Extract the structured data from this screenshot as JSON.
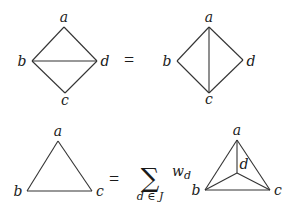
{
  "equations": [
    {
      "id": "eq1",
      "operator": "=",
      "lhs": {
        "graph": "diamond-with-bd-diagonal",
        "vertices": {
          "a": "a",
          "b": "b",
          "c": "c",
          "d": "d"
        },
        "edges": [
          [
            "a",
            "b"
          ],
          [
            "a",
            "d"
          ],
          [
            "b",
            "c"
          ],
          [
            "c",
            "d"
          ],
          [
            "b",
            "d"
          ]
        ]
      },
      "rhs": {
        "graph": "diamond-with-ac-diagonal",
        "vertices": {
          "a": "a",
          "b": "b",
          "c": "c",
          "d": "d"
        },
        "edges": [
          [
            "a",
            "b"
          ],
          [
            "a",
            "d"
          ],
          [
            "b",
            "c"
          ],
          [
            "c",
            "d"
          ],
          [
            "a",
            "c"
          ]
        ]
      }
    },
    {
      "id": "eq2",
      "operator": "=",
      "lhs": {
        "graph": "triangle",
        "vertices": {
          "a": "a",
          "b": "b",
          "c": "c"
        },
        "edges": [
          [
            "a",
            "b"
          ],
          [
            "b",
            "c"
          ],
          [
            "a",
            "c"
          ]
        ]
      },
      "summation": {
        "symbol": "∑",
        "index": "d ∈ J",
        "weight": "w",
        "weight_sub": "d"
      },
      "rhs": {
        "graph": "triangle-with-center-d",
        "vertices": {
          "a": "a",
          "b": "b",
          "c": "c",
          "d": "d"
        },
        "edges": [
          [
            "a",
            "b"
          ],
          [
            "b",
            "c"
          ],
          [
            "a",
            "c"
          ],
          [
            "a",
            "d"
          ],
          [
            "b",
            "d"
          ],
          [
            "c",
            "d"
          ]
        ]
      }
    }
  ]
}
